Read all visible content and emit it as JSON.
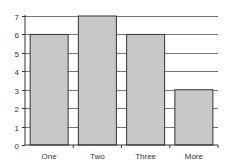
{
  "chart_data": {
    "type": "bar",
    "title": "",
    "xlabel": "",
    "ylabel": "",
    "categories": [
      "One",
      "Two",
      "Three",
      "More"
    ],
    "values": [
      6,
      7,
      6,
      3
    ],
    "ylim": [
      0,
      7
    ],
    "yticks": [
      0,
      1,
      2,
      3,
      4,
      5,
      6,
      7
    ],
    "grid": true,
    "legend": null,
    "colors": {
      "bar_fill": "#c8c8c8",
      "bar_stroke": "#333333",
      "grid": "#555555",
      "axis": "#333333"
    }
  }
}
